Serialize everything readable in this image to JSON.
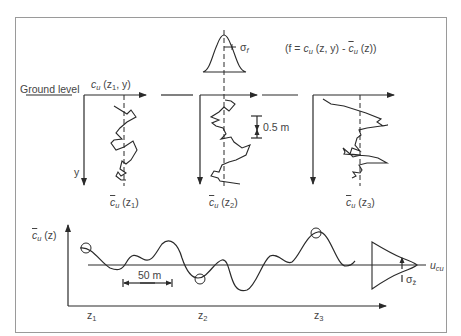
{
  "header": {
    "running_title": "SAFETY ANALYSIS FOR DESIGN",
    "page_number": ""
  },
  "top_panel": {
    "ground_level_label": "Ground level",
    "profile1_axis_label": {
      "var": "c",
      "sub": "u",
      "args": "(z",
      "argsub": "1",
      "tail": ", y)"
    },
    "profile_means": [
      {
        "var": "c",
        "sub": "u",
        "arg": "(z",
        "argsub": "1",
        "close": ")"
      },
      {
        "var": "c",
        "sub": "u",
        "arg": "(z",
        "argsub": "2",
        "close": ")"
      },
      {
        "var": "c",
        "sub": "u",
        "arg": "(z",
        "argsub": "3",
        "close": ")"
      }
    ],
    "y_axis_label": "y",
    "scale_label": "0.5 m",
    "sigma_f_label": {
      "sym": "σ",
      "sub": "f"
    },
    "formula": "(f = cᵤ (z, y) - c̄ᵤ (z))",
    "formula_parts": {
      "open": "(f = ",
      "c1": "c",
      "c1sub": "u",
      "mid": " (z, y) - ",
      "c2": "c",
      "c2sub": "u",
      "end": " (z))"
    }
  },
  "bottom_panel": {
    "y_axis_label": {
      "var": "c",
      "sub": "u",
      "arg": " (z)"
    },
    "distance_label": "50 m",
    "x_ticks": [
      {
        "sym": "z",
        "sub": "1"
      },
      {
        "sym": "z",
        "sub": "2"
      },
      {
        "sym": "z",
        "sub": "3"
      }
    ],
    "mean_label": {
      "sym": "u",
      "sub": "cu"
    },
    "sigma_label": {
      "sym": "σ",
      "sub": "z̄"
    }
  },
  "colors": {
    "line": "#2a2a2a",
    "frame": "#9a9a9a",
    "text": "#444444",
    "background": "#ffffff"
  }
}
